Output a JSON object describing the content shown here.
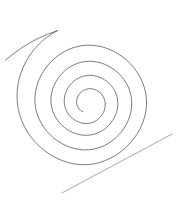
{
  "figure": {
    "title": "",
    "background_color": "#ffffff",
    "width": 177,
    "height": 204,
    "stroke_color_spiral": "#5a5a5a",
    "stroke_color_tangent": "#8a8a8a",
    "stroke_width": 0.8
  },
  "chart_data": {
    "type": "line",
    "title": "",
    "subtitle": "",
    "xlabel": "",
    "ylabel": "",
    "grid": false,
    "legend": null,
    "xlim": [
      0,
      177
    ],
    "ylim": [
      0,
      204
    ],
    "axis_visible": false,
    "tick_labels_x": [],
    "tick_labels_y": [],
    "annotations": [],
    "series": [
      {
        "name": "spiral",
        "kind": "logarithmic-spiral",
        "center": [
          88,
          94
        ],
        "turns": 1.75,
        "start_radius": 9,
        "end_radius": 86,
        "start_angle_deg": 95,
        "direction": "counterclockwise-outward",
        "inner_end_point": [
          82,
          112
        ],
        "outer_end_point": [
          5,
          42
        ],
        "extreme_top": [
          98,
          13
        ],
        "extreme_right": [
          158,
          90
        ],
        "extreme_bottom": [
          101,
          168
        ],
        "extreme_left_inner": [
          40,
          105
        ],
        "path": "M 82.8,111.6 C 78.6,110.2 76.4,106.0 76.6,101.6 C 76.9,95.3 81.7,89.7 88.2,88.8 C 96.2,87.7 103.6,93.8 105.0,101.5 C 106.7,110.8 100.4,120.2 91.4,122.8 C 80.4,125.9 68.8,118.6 65.3,107.9 C 61.2,95.3 69.2,81.3 81.4,76.8 C 95.5,71.6 111.4,80.6 116.3,94.5 C 121.9,110.3 111.8,127.9 96.3,133.5 C 78.7,139.9 58.9,128.6 52.8,111.3 C 46.0,91.8 58.5,69.9 77.6,63.3 C 98.9,55.9 122.6,69.7 129.7,90.7 C 137.6,114.0 122.0,140.0 99.0,147.7 C 73.6,156.2 45.3,139.0 37.1,113.9 C 28.2,86.5 46.9,56.0 74.1,47.4 C 103.6,38.1 135.6,58.5 144.4,87.6 C 153.9,119.1 131.2,153.3 99.7,162.5 C 65.8,172.4 29.0,147.9 19.5,114.2 C 15.2,98.9 16.6,82.2 23.0,67.6 C 29.9,51.8 42.2,38.5 57.5,30.6 C 45.1,34.6 33.5,40.1 23.3,46.8 C 17.0,50.9 11.0,55.4 5.4,60.3"
      },
      {
        "name": "tangent-line",
        "kind": "straight-segment",
        "start_point": [
          62,
          193
        ],
        "end_point": [
          172,
          134
        ],
        "tangency_point": [
          128,
          158
        ],
        "path": "M 62,193 L 172,134"
      }
    ]
  }
}
